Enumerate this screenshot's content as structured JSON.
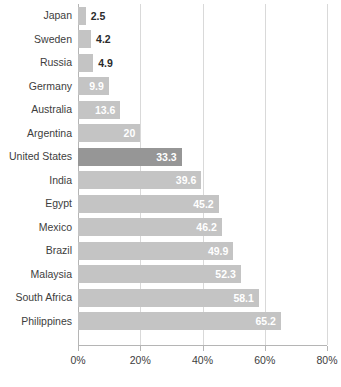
{
  "chart_data": {
    "type": "bar",
    "orientation": "horizontal",
    "title": "",
    "subtitle": "",
    "xlabel": "",
    "ylabel": "",
    "xlim": [
      0,
      80
    ],
    "grid": true,
    "legend": false,
    "value_suffix": "%",
    "x_ticks": [
      {
        "value": 0,
        "label": "0%"
      },
      {
        "value": 20,
        "label": "20%"
      },
      {
        "value": 40,
        "label": "40%"
      },
      {
        "value": 60,
        "label": "60%"
      },
      {
        "value": 80,
        "label": "80%"
      }
    ],
    "categories": [
      "Japan",
      "Sweden",
      "Russia",
      "Germany",
      "Australia",
      "Argentina",
      "United States",
      "India",
      "Egypt",
      "Mexico",
      "Brazil",
      "Malaysia",
      "South Africa",
      "Philippines"
    ],
    "values": [
      2.5,
      4.2,
      4.9,
      9.9,
      13.6,
      20,
      33.3,
      39.6,
      45.2,
      46.2,
      49.9,
      52.3,
      58.1,
      65.2
    ],
    "value_labels": [
      "2.5",
      "4.2",
      "4.9",
      "9.9",
      "13.6",
      "20",
      "33.3",
      "39.6",
      "45.2",
      "46.2",
      "49.9",
      "52.3",
      "58.1",
      "65.2"
    ],
    "highlight_category": "United States",
    "colors": {
      "bar": "#c4c4c4",
      "bar_highlight": "#969696",
      "label_inside": "#ffffff",
      "label_outside": "#2b2b2b",
      "axis": "#b5b5b5",
      "gridline": "#d9d9d9",
      "text": "#3d3d3d",
      "background": "#ffffff"
    },
    "bars": [
      {
        "category": "Japan",
        "value": 2.5,
        "label": "2.5",
        "label_position": "outside",
        "highlighted": false
      },
      {
        "category": "Sweden",
        "value": 4.2,
        "label": "4.2",
        "label_position": "outside",
        "highlighted": false
      },
      {
        "category": "Russia",
        "value": 4.9,
        "label": "4.9",
        "label_position": "outside",
        "highlighted": false
      },
      {
        "category": "Germany",
        "value": 9.9,
        "label": "9.9",
        "label_position": "inside",
        "highlighted": false
      },
      {
        "category": "Australia",
        "value": 13.6,
        "label": "13.6",
        "label_position": "inside",
        "highlighted": false
      },
      {
        "category": "Argentina",
        "value": 20,
        "label": "20",
        "label_position": "inside",
        "highlighted": false
      },
      {
        "category": "United States",
        "value": 33.3,
        "label": "33.3",
        "label_position": "inside",
        "highlighted": true
      },
      {
        "category": "India",
        "value": 39.6,
        "label": "39.6",
        "label_position": "inside",
        "highlighted": false
      },
      {
        "category": "Egypt",
        "value": 45.2,
        "label": "45.2",
        "label_position": "inside",
        "highlighted": false
      },
      {
        "category": "Mexico",
        "value": 46.2,
        "label": "46.2",
        "label_position": "inside",
        "highlighted": false
      },
      {
        "category": "Brazil",
        "value": 49.9,
        "label": "49.9",
        "label_position": "inside",
        "highlighted": false
      },
      {
        "category": "Malaysia",
        "value": 52.3,
        "label": "52.3",
        "label_position": "inside",
        "highlighted": false
      },
      {
        "category": "South Africa",
        "value": 58.1,
        "label": "58.1",
        "label_position": "inside",
        "highlighted": false
      },
      {
        "category": "Philippines",
        "value": 65.2,
        "label": "65.2",
        "label_position": "inside",
        "highlighted": false
      }
    ]
  }
}
